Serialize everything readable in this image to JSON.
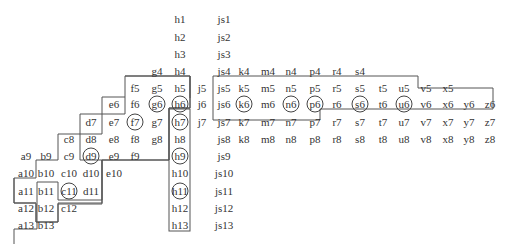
{
  "diagram": {
    "line_color": "#555555",
    "text_color": "#333333",
    "rows": {
      "1": [
        "h1",
        "js1"
      ],
      "2": [
        "h2",
        "js2"
      ],
      "3": [
        "h3",
        "js3"
      ],
      "4": [
        "g4",
        "h4",
        "js4",
        "k4",
        "m4",
        "n4",
        "p4",
        "r4",
        "s4"
      ],
      "5": [
        "f5",
        "g5",
        "h5",
        "j5",
        "js5",
        "k5",
        "m5",
        "n5",
        "p5",
        "r5",
        "s5",
        "t5",
        "u5",
        "v5",
        "x5"
      ],
      "6": [
        "e6",
        "f6",
        "g6",
        "h6",
        "j6",
        "js6",
        "k6",
        "m6",
        "n6",
        "p6",
        "r6",
        "s6",
        "t6",
        "u6",
        "v6",
        "x6",
        "y6",
        "z6"
      ],
      "7": [
        "d7",
        "e7",
        "f7",
        "g7",
        "h7",
        "j7",
        "js7",
        "k7",
        "m7",
        "n7",
        "p7",
        "r7",
        "s7",
        "t7",
        "u7",
        "v7",
        "x7",
        "y7",
        "z7"
      ],
      "8": [
        "c8",
        "d8",
        "e8",
        "f8",
        "g8",
        "h8",
        "js8",
        "k8",
        "m8",
        "n8",
        "p8",
        "r8",
        "s8",
        "t8",
        "u8",
        "v8",
        "x8",
        "y8",
        "z8"
      ],
      "9": [
        "a9",
        "b9",
        "c9",
        "d9",
        "e9",
        "f9",
        "h9",
        "js9"
      ],
      "10": [
        "a10",
        "b10",
        "c10",
        "d10",
        "e10",
        "h10",
        "js10"
      ],
      "11": [
        "a11",
        "b11",
        "c11",
        "d11",
        "h11",
        "js11"
      ],
      "12": [
        "a12",
        "b12",
        "c12",
        "h12",
        "js12"
      ],
      "13": [
        "a13",
        "b13",
        "h13",
        "js13"
      ]
    },
    "circled_nodes": [
      "g6",
      "h6",
      "f7",
      "h7",
      "d9",
      "h9",
      "c11",
      "h11",
      "k6",
      "n6",
      "p6",
      "s6",
      "u6"
    ]
  }
}
